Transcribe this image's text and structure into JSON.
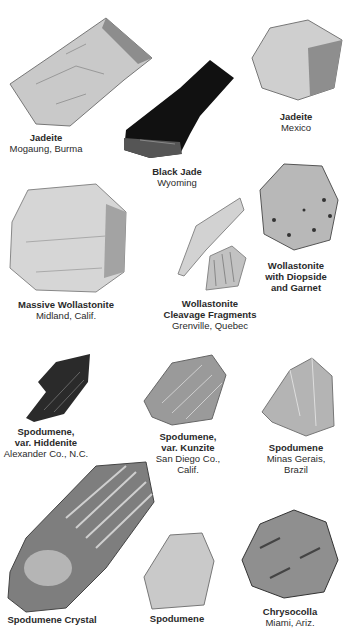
{
  "plate": {
    "specimens": [
      {
        "name": "Jadeite",
        "name2": "",
        "location": "Mogaung, Burma",
        "location2": ""
      },
      {
        "name": "Black Jade",
        "name2": "",
        "location": "Wyoming",
        "location2": ""
      },
      {
        "name": "Jadeite",
        "name2": "",
        "location": "Mexico",
        "location2": ""
      },
      {
        "name": "Massive Wollastonite",
        "name2": "",
        "location": "Midland, Calif.",
        "location2": ""
      },
      {
        "name": "Wollastonite",
        "name2": "Cleavage Fragments",
        "location": "Grenville, Quebec",
        "location2": ""
      },
      {
        "name": "Wollastonite",
        "name2": "with Diopside",
        "name3": "and Garnet",
        "location": "",
        "location2": ""
      },
      {
        "name": "Spodumene,",
        "name2": "var. Hiddenite",
        "location": "Alexander Co., N.C.",
        "location2": ""
      },
      {
        "name": "Spodumene,",
        "name2": "var. Kunzite",
        "location": "San Diego Co.,",
        "location2": "Calif."
      },
      {
        "name": "Spodumene",
        "name2": "",
        "location": "Minas Gerais,",
        "location2": "Brazil"
      },
      {
        "name": "Spodumene Crystal",
        "name2": "",
        "location": "",
        "location2": ""
      },
      {
        "name": "Spodumene",
        "name2": "",
        "location": "",
        "location2": ""
      },
      {
        "name": "Chrysocolla",
        "name2": "",
        "location": "Miami, Ariz.",
        "location2": ""
      }
    ]
  }
}
